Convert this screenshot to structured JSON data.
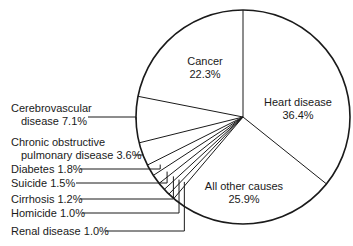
{
  "chart_data": {
    "type": "pie",
    "title": "",
    "start_angle_deg": 0,
    "direction": "clockwise",
    "slices": [
      {
        "label": "Heart disease",
        "value": 36.4,
        "display": "36.4%"
      },
      {
        "label": "All other causes",
        "value": 25.9,
        "display": "25.9%"
      },
      {
        "label": "Renal disease",
        "value": 1.0,
        "display": "1.0%"
      },
      {
        "label": "Homicide",
        "value": 1.0,
        "display": "1.0%"
      },
      {
        "label": "Cirrhosis",
        "value": 1.2,
        "display": "1.2%"
      },
      {
        "label": "Suicide",
        "value": 1.5,
        "display": "1.5%"
      },
      {
        "label": "Diabetes",
        "value": 1.8,
        "display": "1.8%"
      },
      {
        "label": "Chronic obstructive pulmonary disease",
        "value": 3.6,
        "display": "3.6%"
      },
      {
        "label": "Cerebrovascular disease",
        "value": 7.1,
        "display": "7.1%"
      },
      {
        "label": "Cancer",
        "value": 22.3,
        "display": "22.3%"
      }
    ]
  },
  "labels": {
    "heart": {
      "line1": "Heart disease",
      "line2": "36.4%"
    },
    "cancer": {
      "line1": "Cancer",
      "line2": "22.3%"
    },
    "other": {
      "line1": "All other causes",
      "line2": "25.9%"
    },
    "cerebro": {
      "line1": "Cerebrovascular",
      "line2": "disease 7.1%"
    },
    "copd": {
      "line1": "Chronic obstructive",
      "line2": "pulmonary disease 3.6%"
    },
    "diabetes": "Diabetes 1.8%",
    "suicide": "Suicide 1.5%",
    "cirrhosis": "Cirrhosis 1.2%",
    "homicide": "Homicide 1.0%",
    "renal": "Renal disease 1.0%"
  }
}
